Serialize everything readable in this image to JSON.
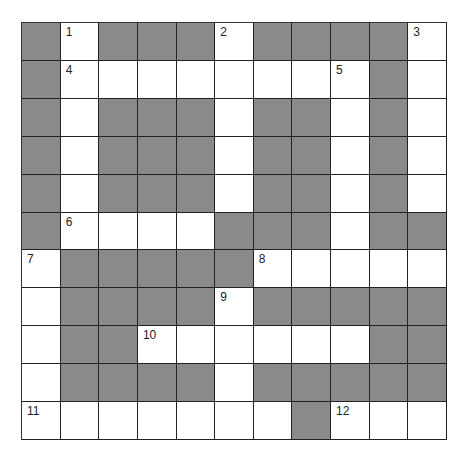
{
  "puzzle": {
    "rows": 11,
    "cols": 11,
    "colors": {
      "block": "#8a8a8a",
      "open": "#ffffff",
      "line": "#222222"
    },
    "layout": [
      "#.###.####.",
      "#........#.",
      "#.###.##.#.",
      "#.###.##.#.",
      "#.###.##.#.",
      "#....###.##",
      ".#####.....",
      ".####.#####",
      ".##......##",
      ".####.#####",
      ".......#..."
    ],
    "numbers": [
      {
        "row": 0,
        "col": 1,
        "n": "1"
      },
      {
        "row": 0,
        "col": 5,
        "n": "2"
      },
      {
        "row": 0,
        "col": 10,
        "n": "3"
      },
      {
        "row": 1,
        "col": 1,
        "n": "4"
      },
      {
        "row": 1,
        "col": 8,
        "n": "5"
      },
      {
        "row": 5,
        "col": 1,
        "n": "6"
      },
      {
        "row": 6,
        "col": 0,
        "n": "7"
      },
      {
        "row": 6,
        "col": 6,
        "n": "8"
      },
      {
        "row": 7,
        "col": 5,
        "n": "9"
      },
      {
        "row": 8,
        "col": 3,
        "n": "10"
      },
      {
        "row": 10,
        "col": 0,
        "n": "11"
      },
      {
        "row": 10,
        "col": 8,
        "n": "12"
      }
    ]
  }
}
